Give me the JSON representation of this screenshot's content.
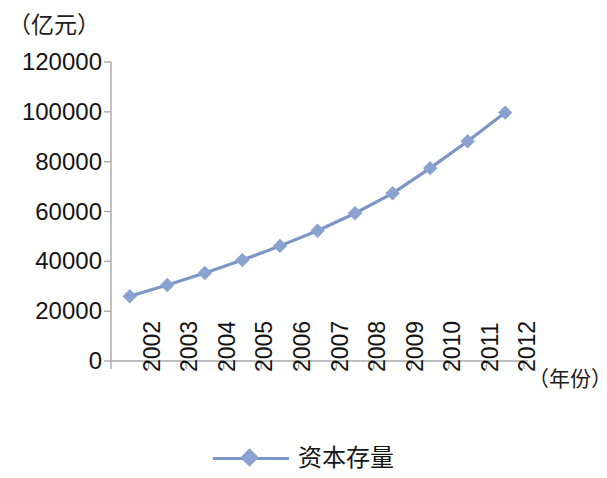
{
  "chart_data": {
    "type": "line",
    "title": "",
    "subtitle": "",
    "xlabel": "（年份）",
    "ylabel": "（亿元）",
    "categories": [
      "2002",
      "2003",
      "2004",
      "2005",
      "2006",
      "2007",
      "2008",
      "2009",
      "2010",
      "2011",
      "2012"
    ],
    "series": [
      {
        "name": "资本存量",
        "values": [
          26000,
          30500,
          35300,
          40500,
          46200,
          52300,
          59300,
          67300,
          77400,
          88200,
          99700
        ],
        "color": "#7d96c8",
        "marker": "diamond"
      }
    ],
    "ylim": [
      0,
      120000
    ],
    "yticks": [
      "0",
      "20000",
      "40000",
      "60000",
      "80000",
      "100000",
      "120000"
    ],
    "ytick_values": [
      0,
      20000,
      40000,
      60000,
      80000,
      100000,
      120000
    ],
    "grid": false,
    "legend_position": "bottom",
    "legend_entries": [
      "资本存量"
    ],
    "axis_color": "#a8a8a8",
    "xtick_rotation": -90
  },
  "axes": {
    "y_unit_label": "（亿元）",
    "x_unit_label": "（年份）"
  },
  "legend": {
    "label": "资本存量"
  }
}
